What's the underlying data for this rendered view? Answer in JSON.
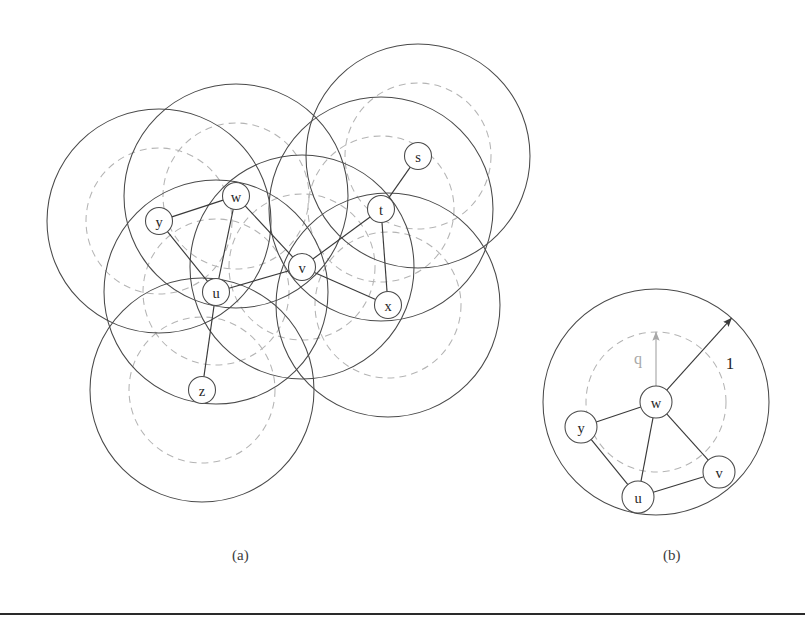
{
  "figure": {
    "panels": [
      {
        "id": "a",
        "caption": "(a)",
        "description": "unit disk graph with transmission disks of radius 1 and inner disks of radius q",
        "nodes": [
          {
            "label": "s",
            "x": 418,
            "y": 156,
            "r": 13.5
          },
          {
            "label": "t",
            "x": 381,
            "y": 209,
            "r": 13.5
          },
          {
            "label": "w",
            "x": 236,
            "y": 196,
            "r": 13.5
          },
          {
            "label": "y",
            "x": 159,
            "y": 221,
            "r": 13.5
          },
          {
            "label": "v",
            "x": 302,
            "y": 267,
            "r": 13.5
          },
          {
            "label": "u",
            "x": 216,
            "y": 292,
            "r": 13.5
          },
          {
            "label": "x",
            "x": 388,
            "y": 305,
            "r": 13.5
          },
          {
            "label": "z",
            "x": 202,
            "y": 390,
            "r": 13.5
          }
        ],
        "edges": [
          [
            "y",
            "w"
          ],
          [
            "y",
            "u"
          ],
          [
            "w",
            "u"
          ],
          [
            "w",
            "v"
          ],
          [
            "u",
            "v"
          ],
          [
            "u",
            "z"
          ],
          [
            "v",
            "t"
          ],
          [
            "v",
            "x"
          ],
          [
            "t",
            "x"
          ],
          [
            "t",
            "s"
          ]
        ],
        "disk_radius_solid": 112,
        "disk_radius_dashed": 73
      },
      {
        "id": "b",
        "caption": "(b)",
        "description": "close-up of node w showing radius 1 disk and radius q disk",
        "center_node": "w",
        "nodes": [
          {
            "label": "w",
            "x": 656,
            "y": 402,
            "r": 16
          },
          {
            "label": "y",
            "x": 581,
            "y": 427,
            "r": 16
          },
          {
            "label": "u",
            "x": 638,
            "y": 497,
            "r": 16
          },
          {
            "label": "v",
            "x": 719,
            "y": 472,
            "r": 16
          }
        ],
        "edges": [
          [
            "w",
            "y"
          ],
          [
            "w",
            "u"
          ],
          [
            "w",
            "v"
          ],
          [
            "y",
            "u"
          ],
          [
            "u",
            "v"
          ]
        ],
        "disk_radius_solid": 113,
        "disk_radius_dashed": 70,
        "annotations": [
          {
            "label": "q",
            "kind": "dashed-radius",
            "label_x": 638,
            "label_y": 358
          },
          {
            "label": "1",
            "kind": "solid-radius",
            "label_x": 730,
            "label_y": 363
          }
        ]
      }
    ],
    "colors": {
      "solid_stroke": "#4a4a4a",
      "dashed_stroke": "#b4b4b4",
      "edge_stroke": "#3a3a3a",
      "label_fill": "#262626",
      "dashed_label_fill": "#a8a8a8",
      "background": "#ffffff",
      "rule": "#2a2a2a"
    }
  },
  "chart_data": {
    "type": "diagram",
    "title": "",
    "subtitle": "",
    "panel_a": {
      "vertices": [
        "s",
        "t",
        "w",
        "y",
        "v",
        "u",
        "x",
        "z"
      ],
      "positions": {
        "s": [
          418,
          156
        ],
        "t": [
          381,
          209
        ],
        "w": [
          236,
          196
        ],
        "y": [
          159,
          221
        ],
        "v": [
          302,
          267
        ],
        "u": [
          216,
          292
        ],
        "x": [
          388,
          305
        ],
        "z": [
          202,
          390
        ]
      },
      "edges": [
        [
          "y",
          "w"
        ],
        [
          "y",
          "u"
        ],
        [
          "w",
          "u"
        ],
        [
          "w",
          "v"
        ],
        [
          "u",
          "v"
        ],
        [
          "u",
          "z"
        ],
        [
          "v",
          "t"
        ],
        [
          "v",
          "x"
        ],
        [
          "t",
          "x"
        ],
        [
          "t",
          "s"
        ]
      ],
      "disk_radii": {
        "transmission": 112,
        "inner": 73
      }
    },
    "panel_b": {
      "vertices": [
        "w",
        "y",
        "u",
        "v"
      ],
      "positions": {
        "w": [
          656,
          402
        ],
        "y": [
          581,
          427
        ],
        "u": [
          638,
          497
        ],
        "v": [
          719,
          472
        ]
      },
      "edges": [
        [
          "w",
          "y"
        ],
        [
          "w",
          "u"
        ],
        [
          "w",
          "v"
        ],
        [
          "y",
          "u"
        ],
        [
          "u",
          "v"
        ]
      ],
      "disk_radii": {
        "transmission": 113,
        "inner": 70
      },
      "radius_labels": [
        "q",
        "1"
      ]
    }
  }
}
